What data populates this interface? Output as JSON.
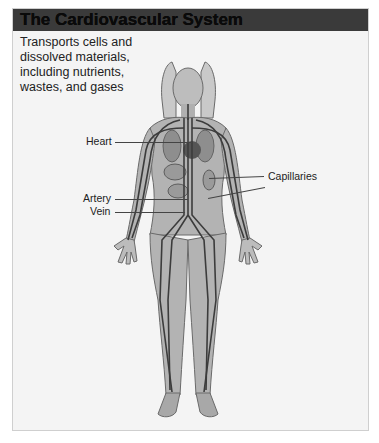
{
  "header": {
    "title": "The Cardiovascular System"
  },
  "description": "Transports cells and dissolved materials, including nutrients, wastes, and gases",
  "labels": {
    "heart": "Heart",
    "capillaries": "Capillaries",
    "artery": "Artery",
    "vein": "Vein"
  },
  "colors": {
    "header_bar": "#3a3a3a",
    "panel_bg": "#f4f4f4",
    "vessel": "#3c3c3c",
    "skin": "#b8b8b8"
  }
}
